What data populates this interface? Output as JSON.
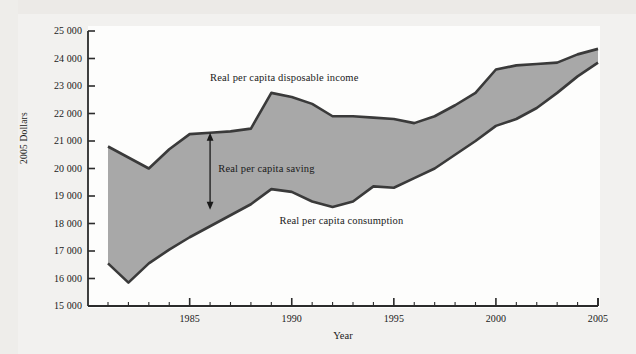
{
  "chart_data": {
    "type": "area",
    "title": "",
    "xlabel": "Year",
    "ylabel": "2005 Dollars",
    "xlim": [
      1981,
      2005
    ],
    "ylim": [
      15000,
      25000
    ],
    "grid": false,
    "legend_position": "inline-annotations",
    "x": [
      1981,
      1982,
      1983,
      1984,
      1985,
      1986,
      1987,
      1988,
      1989,
      1990,
      1991,
      1992,
      1993,
      1994,
      1995,
      1996,
      1997,
      1998,
      1999,
      2000,
      2001,
      2002,
      2003,
      2004,
      2005
    ],
    "series": [
      {
        "name": "Real per capita disposable income",
        "values": [
          20800,
          20400,
          20000,
          20700,
          21250,
          21300,
          21350,
          21450,
          22750,
          22600,
          22350,
          21900,
          21900,
          21850,
          21800,
          21650,
          21900,
          22300,
          22750,
          23600,
          23750,
          23800,
          23850,
          24150,
          24350
        ]
      },
      {
        "name": "Real per capita consumption",
        "values": [
          16550,
          15850,
          16550,
          17050,
          17500,
          17900,
          18300,
          18700,
          19250,
          19150,
          18800,
          18600,
          18800,
          19350,
          19300,
          19650,
          20000,
          20500,
          21000,
          21550,
          21800,
          22200,
          22750,
          23350,
          23850
        ]
      }
    ],
    "x_tick_labels": [
      "1985",
      "1990",
      "1995",
      "2000",
      "2005"
    ],
    "x_tick_values": [
      1985,
      1990,
      1995,
      2000,
      2005
    ],
    "y_tick_labels": [
      "15 000",
      "16 000",
      "17 000",
      "18 000",
      "19 000",
      "20 000",
      "21 000",
      "22 000",
      "23 000",
      "24 000",
      "25 000"
    ],
    "y_tick_values": [
      15000,
      16000,
      17000,
      18000,
      19000,
      20000,
      21000,
      22000,
      23000,
      24000,
      25000
    ],
    "annotations": [
      {
        "name": "income-label",
        "text": "Real per capita disposable income",
        "x": 1986.0,
        "y": 23250
      },
      {
        "name": "saving-label",
        "text": "Real per capita saving",
        "x": 1986.4,
        "y": 19950
      },
      {
        "name": "consumption-label",
        "text": "Real per capita consumption",
        "x": 1989.4,
        "y": 18050
      },
      {
        "name": "saving-arrow",
        "text": "",
        "x": 1986.0,
        "y_from": 21300,
        "y_to": 18500
      }
    ],
    "colors": {
      "band_fill": "#a8a8a8",
      "line": "#3a3a3a",
      "axis": "#2b2b2b",
      "background": "#fdfdfc",
      "page": "#f2f1ef",
      "text": "#1a1a1a"
    }
  }
}
